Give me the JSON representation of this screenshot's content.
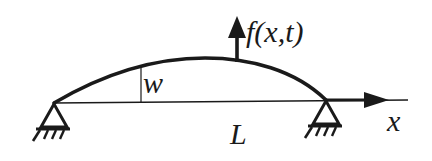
{
  "diagram": {
    "labels": {
      "force": "f(x,t)",
      "deflection": "w",
      "length": "L",
      "axis": "x"
    },
    "elements": {
      "beam_curve": "deflected beam shape",
      "baseline": "undeformed beam axis",
      "left_support": "pin support",
      "right_support": "pin support",
      "force_arrow": "upward distributed load arrow",
      "axis_arrow": "x-axis arrow"
    },
    "colors": {
      "stroke": "#1a1a1a",
      "background": "#ffffff"
    }
  }
}
